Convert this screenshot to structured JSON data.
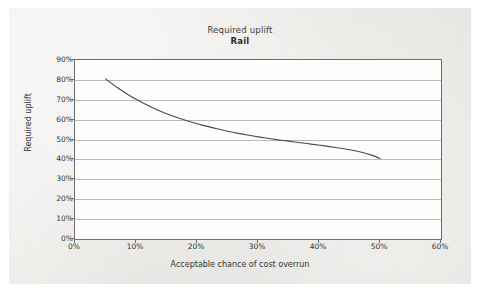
{
  "figure": {
    "background_color": "#e9e8e4",
    "plot_background_color": "#fdfdfc",
    "frame_color": "#6d6d6d",
    "gridline_color": "#b9b9b9",
    "series_color": "#4a4a4a"
  },
  "chart_data": {
    "type": "line",
    "title": "Required uplift",
    "subtitle": "Rail",
    "xlabel": "Acceptable chance of cost overrun",
    "ylabel": "Required uplift",
    "xlim": [
      0,
      60
    ],
    "ylim": [
      0,
      90
    ],
    "xtick_labels": [
      "0%",
      "10%",
      "20%",
      "30%",
      "40%",
      "50%",
      "60%"
    ],
    "xticks": [
      0,
      10,
      20,
      30,
      40,
      50,
      60
    ],
    "ytick_labels": [
      "0%",
      "10%",
      "20%",
      "30%",
      "40%",
      "50%",
      "60%",
      "70%",
      "80%",
      "90%"
    ],
    "yticks": [
      0,
      10,
      20,
      30,
      40,
      50,
      60,
      70,
      80,
      90
    ],
    "grid": "horizontal",
    "legend": "none",
    "series": [
      {
        "name": "Rail",
        "x": [
          5,
          7,
          9,
          11,
          13,
          15,
          17,
          19,
          21,
          23,
          25,
          27,
          29,
          31,
          33,
          35,
          37,
          39,
          41,
          43,
          45,
          47,
          49,
          50
        ],
        "y": [
          80.5,
          76.0,
          72.0,
          68.6,
          65.6,
          63.0,
          60.8,
          58.8,
          57.1,
          55.6,
          54.2,
          53.0,
          51.9,
          50.9,
          50.0,
          49.2,
          48.4,
          47.6,
          46.8,
          45.9,
          44.9,
          43.6,
          41.8,
          40.5
        ]
      }
    ]
  }
}
